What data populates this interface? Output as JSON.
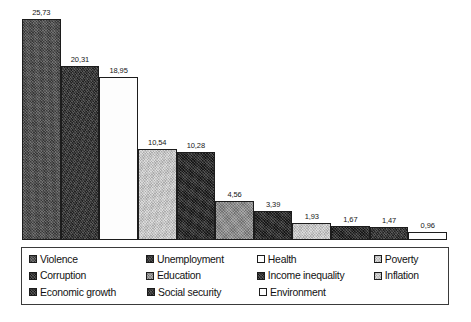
{
  "chart_data": {
    "type": "bar",
    "title": "",
    "subtitle": "",
    "xlabel": "",
    "ylabel": "",
    "ylim": [
      0,
      27
    ],
    "grid": false,
    "legend_position": "bottom",
    "categories": [
      "Violence",
      "Unemployment",
      "Health",
      "Poverty",
      "Corruption",
      "Education",
      "Income inequality",
      "Inflation",
      "Economic growth",
      "Social security",
      "Environment"
    ],
    "values": [
      25.73,
      20.31,
      18.95,
      10.54,
      10.28,
      4.56,
      3.39,
      1.93,
      1.67,
      1.47,
      0.96
    ],
    "value_labels": [
      "25,73",
      "20,31",
      "18,95",
      "10,54",
      "10,28",
      "4,56",
      "3,39",
      "1,93",
      "1,67",
      "1,47",
      "0,96"
    ],
    "bars": [
      {
        "label": "Violence",
        "value": 25.73,
        "value_label": "25,73",
        "fill": "dkgray",
        "color": "#4a4a4a"
      },
      {
        "label": "Unemployment",
        "value": 20.31,
        "value_label": "20,31",
        "fill": "vdark",
        "color": "#2d2d2d"
      },
      {
        "label": "Health",
        "value": 18.95,
        "value_label": "18,95",
        "fill": "white",
        "color": "#fdfdfd"
      },
      {
        "label": "Poverty",
        "value": 10.54,
        "value_label": "10,54",
        "fill": "ltgray",
        "color": "#c8c8c8"
      },
      {
        "label": "Corruption",
        "value": 10.28,
        "value_label": "10,28",
        "fill": "black",
        "color": "#1e1e1e"
      },
      {
        "label": "Education",
        "value": 4.56,
        "value_label": "4,56",
        "fill": "mdgray",
        "color": "#8a8a8a"
      },
      {
        "label": "Income inequality",
        "value": 3.39,
        "value_label": "3,39",
        "fill": "black",
        "color": "#1e1e1e"
      },
      {
        "label": "Inflation",
        "value": 1.93,
        "value_label": "1,93",
        "fill": "ltgray",
        "color": "#c8c8c8"
      },
      {
        "label": "Economic growth",
        "value": 1.67,
        "value_label": "1,67",
        "fill": "black",
        "color": "#1e1e1e"
      },
      {
        "label": "Social security",
        "value": 1.47,
        "value_label": "1,47",
        "fill": "vdark",
        "color": "#2d2d2d"
      },
      {
        "label": "Environment",
        "value": 0.96,
        "value_label": "0,96",
        "fill": "white",
        "color": "#fdfdfd"
      }
    ]
  },
  "legend": {
    "rows": [
      [
        {
          "label": "Violence",
          "fill": "dkgray"
        },
        {
          "label": "Unemployment",
          "fill": "vdark"
        },
        {
          "label": "Health",
          "fill": "white"
        },
        {
          "label": "Poverty",
          "fill": "ltgray"
        }
      ],
      [
        {
          "label": "Corruption",
          "fill": "black"
        },
        {
          "label": "Education",
          "fill": "mdgray"
        },
        {
          "label": "Income inequality",
          "fill": "black"
        },
        {
          "label": "Inflation",
          "fill": "ltgray"
        }
      ],
      [
        {
          "label": "Economic growth",
          "fill": "black"
        },
        {
          "label": "Social security",
          "fill": "vdark"
        },
        {
          "label": "Environment",
          "fill": "white"
        }
      ]
    ]
  }
}
